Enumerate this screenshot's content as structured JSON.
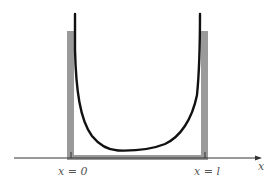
{
  "diagram": {
    "type": "potential-well-wavefunction",
    "labels": {
      "left_wall": "x = 0",
      "right_wall": "x = l",
      "axis": "x"
    },
    "colors": {
      "background": "#ffffff",
      "wall": "#9a9a9a",
      "curve": "#111111",
      "axis": "#333333",
      "label": "#555555"
    }
  }
}
